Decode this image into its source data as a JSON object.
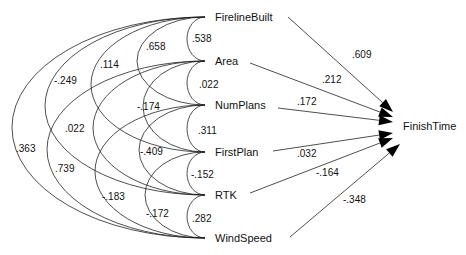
{
  "diagram": {
    "type": "path-diagram",
    "outcome": {
      "label": "FinishTime",
      "x": 403,
      "y": 126
    },
    "predictors": [
      {
        "id": "FirelineBuilt",
        "label": "FirelineBuilt",
        "y": 17
      },
      {
        "id": "Area",
        "label": "Area",
        "y": 61
      },
      {
        "id": "NumPlans",
        "label": "NumPlans",
        "y": 105
      },
      {
        "id": "FirstPlan",
        "label": "FirstPlan",
        "y": 152
      },
      {
        "id": "RTK",
        "label": "RTK",
        "y": 195
      },
      {
        "id": "WindSpeed",
        "label": "WindSpeed",
        "y": 238
      }
    ],
    "path_coefficients": [
      {
        "from": "FirelineBuilt",
        "to": "FinishTime",
        "value": ".609",
        "lx": 352,
        "ly": 58,
        "sx": 288,
        "sy": 17,
        "ex": 393,
        "ey": 112
      },
      {
        "from": "Area",
        "to": "FinishTime",
        "value": ".212",
        "lx": 322,
        "ly": 83,
        "sx": 250,
        "sy": 63,
        "ex": 393,
        "ey": 117
      },
      {
        "from": "NumPlans",
        "to": "FinishTime",
        "value": ".172",
        "lx": 297,
        "ly": 105,
        "sx": 278,
        "sy": 108,
        "ex": 393,
        "ey": 122
      },
      {
        "from": "FirstPlan",
        "to": "FinishTime",
        "value": ".032",
        "lx": 297,
        "ly": 157,
        "sx": 273,
        "sy": 151,
        "ex": 393,
        "ey": 133
      },
      {
        "from": "RTK",
        "to": "FinishTime",
        "value": "-.164",
        "lx": 316,
        "ly": 176,
        "sx": 250,
        "sy": 193,
        "ex": 393,
        "ey": 138
      },
      {
        "from": "WindSpeed",
        "to": "FinishTime",
        "value": "-.348",
        "lx": 343,
        "ly": 203,
        "sx": 290,
        "sy": 237,
        "ex": 400,
        "ey": 144
      }
    ],
    "correlations": [
      {
        "a": "FirelineBuilt",
        "b": "Area",
        "value": ".538",
        "rx": 18,
        "lx": 192,
        "ly": 42
      },
      {
        "a": "Area",
        "b": "NumPlans",
        "value": ".022",
        "rx": 18,
        "lx": 199,
        "ly": 88
      },
      {
        "a": "NumPlans",
        "b": "FirstPlan",
        "value": ".311",
        "lx": 198,
        "ly": 134,
        "rx": 18
      },
      {
        "a": "FirstPlan",
        "b": "RTK",
        "value": "-.152",
        "rx": 18,
        "lx": 191,
        "ly": 178
      },
      {
        "a": "RTK",
        "b": "WindSpeed",
        "value": ".282",
        "rx": 18,
        "lx": 192,
        "ly": 222
      },
      {
        "a": "FirelineBuilt",
        "b": "NumPlans",
        "value": ".658",
        "rx": 68,
        "lx": 146,
        "ly": 50
      },
      {
        "a": "Area",
        "b": "FirstPlan",
        "value": "-.174",
        "rx": 62,
        "lx": 137,
        "ly": 110
      },
      {
        "a": "NumPlans",
        "b": "RTK",
        "value": "-.409",
        "rx": 66,
        "lx": 140,
        "ly": 155
      },
      {
        "a": "FirstPlan",
        "b": "WindSpeed",
        "value": "-.172",
        "rx": 60,
        "lx": 146,
        "ly": 217
      },
      {
        "a": "FirelineBuilt",
        "b": "FirstPlan",
        "value": ".114",
        "rx": 114,
        "lx": 100,
        "ly": 68
      },
      {
        "a": "Area",
        "b": "RTK",
        "value": ".022",
        "rx": 112,
        "lx": 65,
        "ly": 132
      },
      {
        "a": "NumPlans",
        "b": "WindSpeed",
        "value": "-.183",
        "rx": 110,
        "lx": 102,
        "ly": 200
      },
      {
        "a": "FirelineBuilt",
        "b": "RTK",
        "value": "-.249",
        "rx": 160,
        "lx": 54,
        "ly": 84
      },
      {
        "a": "Area",
        "b": "WindSpeed",
        "value": ".739",
        "rx": 158,
        "lx": 55,
        "ly": 172
      },
      {
        "a": "FirelineBuilt",
        "b": "WindSpeed",
        "value": ".363",
        "rx": 193,
        "lx": 16,
        "ly": 152
      }
    ],
    "layout": {
      "arc_anchor_x": 205,
      "label_x": 215
    }
  }
}
